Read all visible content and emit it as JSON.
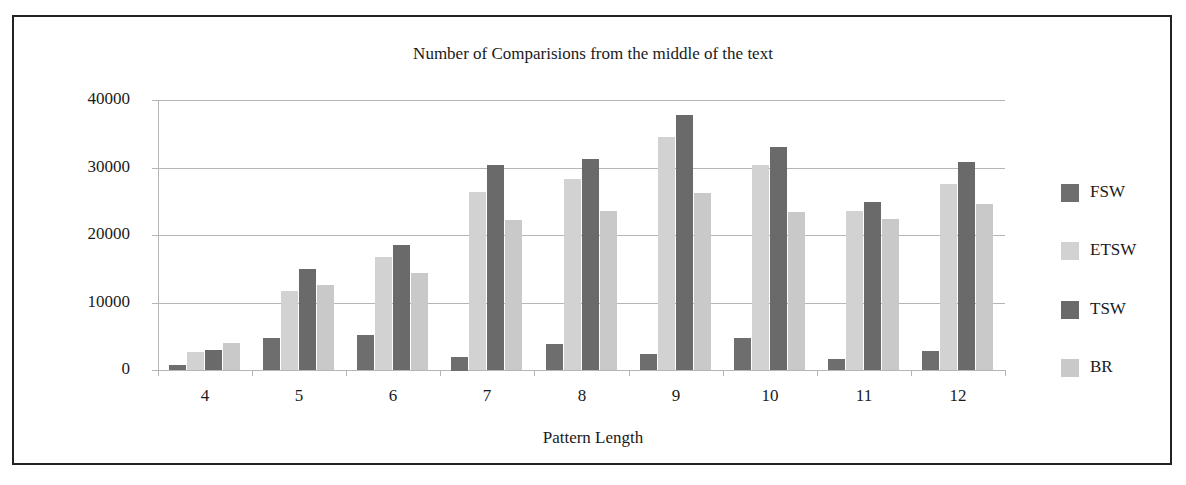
{
  "chart_data": {
    "type": "bar",
    "title": "Number of Comparisions from the middle of the text",
    "xlabel": "Pattern Length",
    "ylabel": "",
    "categories": [
      "4",
      "5",
      "6",
      "7",
      "8",
      "9",
      "10",
      "11",
      "12"
    ],
    "ylim": [
      0,
      40000
    ],
    "yticks": [
      "0",
      "10000",
      "20000",
      "30000",
      "40000"
    ],
    "grid": true,
    "legend_position": "right",
    "series": [
      {
        "name": "FSW",
        "color": "#6e6e6e",
        "values": [
          800,
          4700,
          5200,
          2000,
          3800,
          2300,
          4700,
          1600,
          2800
        ]
      },
      {
        "name": "ETSW",
        "color": "#d2d2d2",
        "values": [
          2700,
          11700,
          16700,
          26400,
          28300,
          34500,
          30300,
          23600,
          27600
        ]
      },
      {
        "name": "TSW",
        "color": "#6a6a6a",
        "values": [
          3000,
          15000,
          18500,
          30300,
          31200,
          37800,
          33100,
          24900,
          30800
        ]
      },
      {
        "name": "BR",
        "color": "#c9c9c9",
        "values": [
          4000,
          12600,
          14400,
          22200,
          23600,
          26200,
          23400,
          22400,
          24600
        ]
      }
    ]
  }
}
